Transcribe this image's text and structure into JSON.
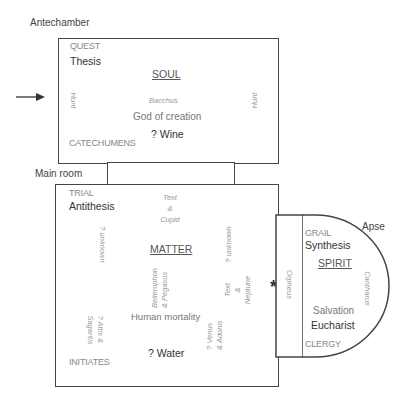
{
  "rooms": {
    "antechamber": {
      "label": "Antechamber",
      "quest": "QUEST",
      "thesis": "Thesis",
      "title": "SOUL",
      "left_vertical": "Hunt",
      "right_vertical": "Hunt",
      "god_name": "Bacchus",
      "god_desc": "God of creation",
      "element": "? Wine",
      "group": "CATECHUMENS"
    },
    "main_room": {
      "label": "Main room",
      "trial": "TRIAL",
      "antithesis": "Antithesis",
      "top_pair_1": "Text",
      "top_pair_amp": "&",
      "top_pair_2": "Cupid",
      "left_vertical": "? unknown",
      "right_vertical": "? unknown",
      "title": "MATTER",
      "bellerophon_1": "Bellerophon",
      "bellerophon_2": "& Pegasus",
      "neptune_1": "Text",
      "neptune_amp": "&",
      "neptune_2": "Neptune",
      "attis_1": "? Attis &",
      "attis_2": "Sagaritis",
      "venus_1": "? Venus",
      "venus_2": "& Adonis",
      "mortality": "Human mortality",
      "element": "? Water",
      "group": "INITIATES"
    },
    "apse": {
      "label": "Apse",
      "grail": "GRAIL",
      "synthesis": "Synthesis",
      "title": "SPIRIT",
      "left_vertical": "Orpheus",
      "right_vertical": "Cantharus",
      "salvation": "Salvation",
      "element": "Eucharist",
      "group": "CLERGY"
    }
  },
  "markers": {
    "entry_arrow": "→",
    "star": "*"
  },
  "colors": {
    "line": "#444444",
    "text_dark": "#333333",
    "text_light": "#888888"
  }
}
